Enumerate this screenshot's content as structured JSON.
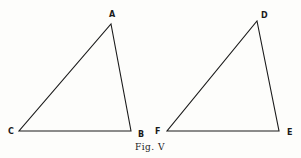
{
  "figure": {
    "caption": "Fig. V",
    "stroke_color": "#1a1a1a",
    "background": "#fdfdfb",
    "triangles": [
      {
        "name": "ABC",
        "vertices": {
          "A": {
            "label": "A",
            "x": 111,
            "y": 24
          },
          "B": {
            "label": "B",
            "x": 131,
            "y": 131
          },
          "C": {
            "label": "C",
            "x": 19,
            "y": 131
          }
        }
      },
      {
        "name": "DEF",
        "vertices": {
          "D": {
            "label": "D",
            "x": 257,
            "y": 21
          },
          "E": {
            "label": "E",
            "x": 279,
            "y": 131
          },
          "F": {
            "label": "F",
            "x": 167,
            "y": 131
          }
        }
      }
    ]
  }
}
